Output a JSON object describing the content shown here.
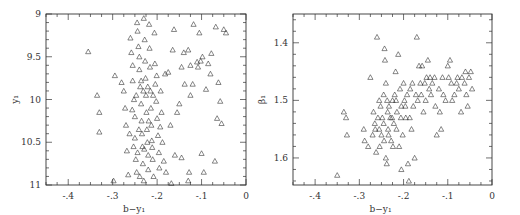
{
  "chart_data": [
    {
      "type": "scatter",
      "title": "",
      "xlabel": "b−y₁",
      "ylabel": "y₁",
      "xlim": [
        -4.5,
        0
      ],
      "ylim": [
        11,
        9
      ],
      "y_inverted": true,
      "x_ticks": [
        -4,
        -3,
        -2,
        -1,
        0
      ],
      "x_tick_labels": [
        "-.4",
        "-.3",
        "-.2",
        "-.1",
        "0"
      ],
      "y_ticks": [
        9,
        9.5,
        10,
        10.5,
        11
      ],
      "y_tick_labels": [
        "9",
        "9.5",
        "10",
        "10.5",
        "11"
      ],
      "marker": "open-triangle",
      "grid": false,
      "legend": null,
      "note": "Points approximated from visual distribution; dense vertical band around b−y≈-0.2 to -0.28",
      "points": [
        [
          -3.55,
          9.44
        ],
        [
          -3.35,
          9.95
        ],
        [
          -3.3,
          10.15
        ],
        [
          -3.3,
          10.38
        ],
        [
          -2.98,
          10.95
        ],
        [
          -2.95,
          9.72
        ],
        [
          -2.8,
          9.8
        ],
        [
          -2.75,
          9.9
        ],
        [
          -2.72,
          10.1
        ],
        [
          -2.7,
          10.3
        ],
        [
          -2.68,
          10.6
        ],
        [
          -2.65,
          10.88
        ],
        [
          -2.6,
          9.28
        ],
        [
          -2.58,
          9.45
        ],
        [
          -2.55,
          9.6
        ],
        [
          -2.55,
          9.78
        ],
        [
          -2.52,
          10.0
        ],
        [
          -2.5,
          10.2
        ],
        [
          -2.5,
          10.45
        ],
        [
          -2.48,
          10.7
        ],
        [
          -2.46,
          10.85
        ],
        [
          -2.45,
          9.1
        ],
        [
          -2.44,
          9.2
        ],
        [
          -2.42,
          9.38
        ],
        [
          -2.4,
          9.5
        ],
        [
          -2.4,
          9.65
        ],
        [
          -2.38,
          9.85
        ],
        [
          -2.36,
          10.05
        ],
        [
          -2.35,
          10.25
        ],
        [
          -2.34,
          10.4
        ],
        [
          -2.33,
          10.55
        ],
        [
          -2.32,
          10.75
        ],
        [
          -2.3,
          10.95
        ],
        [
          -2.3,
          9.05
        ],
        [
          -2.28,
          9.3
        ],
        [
          -2.27,
          9.55
        ],
        [
          -2.26,
          9.75
        ],
        [
          -2.25,
          9.95
        ],
        [
          -2.24,
          10.15
        ],
        [
          -2.23,
          10.35
        ],
        [
          -2.22,
          10.5
        ],
        [
          -2.2,
          10.65
        ],
        [
          -2.2,
          10.82
        ],
        [
          -2.18,
          9.12
        ],
        [
          -2.17,
          9.4
        ],
        [
          -2.16,
          9.62
        ],
        [
          -2.15,
          9.9
        ],
        [
          -2.14,
          10.1
        ],
        [
          -2.13,
          10.3
        ],
        [
          -2.12,
          10.48
        ],
        [
          -2.1,
          10.7
        ],
        [
          -2.08,
          10.9
        ],
        [
          -2.06,
          9.22
        ],
        [
          -2.05,
          9.58
        ],
        [
          -2.04,
          9.82
        ],
        [
          -2.02,
          10.02
        ],
        [
          -2.0,
          10.22
        ],
        [
          -1.98,
          10.42
        ],
        [
          -1.96,
          10.62
        ],
        [
          -1.95,
          10.8
        ],
        [
          -1.92,
          9.9
        ],
        [
          -1.9,
          10.15
        ],
        [
          -1.88,
          10.5
        ],
        [
          -1.85,
          10.72
        ],
        [
          -1.82,
          9.7
        ],
        [
          -1.8,
          10.85
        ],
        [
          -1.75,
          9.68
        ],
        [
          -1.7,
          10.3
        ],
        [
          -1.68,
          10.98
        ],
        [
          -1.65,
          9.42
        ],
        [
          -1.62,
          9.18
        ],
        [
          -1.6,
          10.65
        ],
        [
          -1.55,
          10.15
        ],
        [
          -1.5,
          10.05
        ],
        [
          -1.45,
          10.68
        ],
        [
          -1.45,
          9.62
        ],
        [
          -1.4,
          9.45
        ],
        [
          -1.38,
          9.82
        ],
        [
          -1.3,
          9.42
        ],
        [
          -1.3,
          10.95
        ],
        [
          -1.28,
          10.85
        ],
        [
          -1.25,
          9.95
        ],
        [
          -1.25,
          9.6
        ],
        [
          -1.2,
          9.82
        ],
        [
          -1.18,
          9.12
        ],
        [
          -1.1,
          9.56
        ],
        [
          -1.08,
          9.62
        ],
        [
          -1.05,
          9.22
        ],
        [
          -1.02,
          9.55
        ],
        [
          -1.0,
          10.63
        ],
        [
          -0.98,
          9.5
        ],
        [
          -0.95,
          10.85
        ],
        [
          -0.9,
          9.88
        ],
        [
          -0.85,
          9.58
        ],
        [
          -0.8,
          9.7
        ],
        [
          -0.78,
          9.46
        ],
        [
          -0.7,
          10.72
        ],
        [
          -0.68,
          9.15
        ],
        [
          -0.65,
          10.22
        ],
        [
          -0.62,
          9.8
        ],
        [
          -0.58,
          10.02
        ],
        [
          -0.55,
          10.28
        ],
        [
          -0.5,
          9.18
        ],
        [
          -0.45,
          9.22
        ],
        [
          -2.62,
          10.4
        ],
        [
          -2.56,
          10.12
        ],
        [
          -2.44,
          10.62
        ],
        [
          -2.36,
          9.78
        ],
        [
          -2.29,
          10.58
        ],
        [
          -2.21,
          9.85
        ],
        [
          -2.11,
          10.56
        ],
        [
          -2.01,
          9.72
        ],
        [
          -1.93,
          10.32
        ],
        [
          -2.39,
          10.9
        ],
        [
          -2.47,
          9.95
        ],
        [
          -2.31,
          9.9
        ],
        [
          -2.19,
          10.25
        ],
        [
          -2.09,
          9.95
        ],
        [
          -2.53,
          10.55
        ],
        [
          -2.41,
          10.35
        ]
      ]
    },
    {
      "type": "scatter",
      "title": "",
      "xlabel": "b−y₁",
      "ylabel": "β₁",
      "xlim": [
        -4.5,
        0
      ],
      "ylim": [
        1.647,
        1.35
      ],
      "y_inverted": true,
      "x_ticks": [
        -4,
        -3,
        -2,
        -1,
        0
      ],
      "x_tick_labels": [
        "-.4",
        "-.3",
        "-.2",
        "-.1",
        "0"
      ],
      "y_ticks": [
        1.4,
        1.5,
        1.6
      ],
      "y_tick_labels": [
        "1.4",
        "1.5",
        "1.6"
      ],
      "marker": "open-triangle",
      "grid": false,
      "legend": null,
      "note": "Points approximated; dense cluster trending from (-0.27,1.55) to (-0.1,1.47)",
      "points": [
        [
          -3.5,
          1.63
        ],
        [
          -3.35,
          1.52
        ],
        [
          -3.3,
          1.53
        ],
        [
          -3.28,
          1.56
        ],
        [
          -2.9,
          1.55
        ],
        [
          -2.88,
          1.57
        ],
        [
          -2.8,
          1.58
        ],
        [
          -2.75,
          1.46
        ],
        [
          -2.7,
          1.56
        ],
        [
          -2.68,
          1.52
        ],
        [
          -2.65,
          1.54
        ],
        [
          -2.62,
          1.59
        ],
        [
          -2.6,
          1.39
        ],
        [
          -2.58,
          1.53
        ],
        [
          -2.55,
          1.55
        ],
        [
          -2.52,
          1.51
        ],
        [
          -2.5,
          1.56
        ],
        [
          -2.48,
          1.53
        ],
        [
          -2.45,
          1.54
        ],
        [
          -2.43,
          1.41
        ],
        [
          -2.42,
          1.43
        ],
        [
          -2.4,
          1.47
        ],
        [
          -2.4,
          1.6
        ],
        [
          -2.38,
          1.61
        ],
        [
          -2.36,
          1.52
        ],
        [
          -2.35,
          1.55
        ],
        [
          -2.33,
          1.51
        ],
        [
          -2.3,
          1.53
        ],
        [
          -2.28,
          1.57
        ],
        [
          -2.25,
          1.5
        ],
        [
          -2.22,
          1.54
        ],
        [
          -2.2,
          1.49
        ],
        [
          -2.18,
          1.45
        ],
        [
          -2.15,
          1.52
        ],
        [
          -2.12,
          1.42
        ],
        [
          -2.1,
          1.58
        ],
        [
          -2.08,
          1.48
        ],
        [
          -2.05,
          1.51
        ],
        [
          -2.05,
          1.62
        ],
        [
          -2.02,
          1.56
        ],
        [
          -2.0,
          1.47
        ],
        [
          -1.98,
          1.5
        ],
        [
          -1.95,
          1.53
        ],
        [
          -1.92,
          1.49
        ],
        [
          -1.9,
          1.61
        ],
        [
          -1.88,
          1.64
        ],
        [
          -1.85,
          1.48
        ],
        [
          -1.82,
          1.55
        ],
        [
          -1.8,
          1.47
        ],
        [
          -1.78,
          1.51
        ],
        [
          -1.75,
          1.6
        ],
        [
          -1.72,
          1.49
        ],
        [
          -1.7,
          1.39
        ],
        [
          -1.68,
          1.5
        ],
        [
          -1.65,
          1.44
        ],
        [
          -1.62,
          1.47
        ],
        [
          -1.6,
          1.49
        ],
        [
          -1.58,
          1.44
        ],
        [
          -1.55,
          1.52
        ],
        [
          -1.52,
          1.47
        ],
        [
          -1.5,
          1.5
        ],
        [
          -1.48,
          1.46
        ],
        [
          -1.45,
          1.43
        ],
        [
          -1.42,
          1.48
        ],
        [
          -1.4,
          1.46
        ],
        [
          -1.38,
          1.49
        ],
        [
          -1.35,
          1.47
        ],
        [
          -1.3,
          1.46
        ],
        [
          -1.28,
          1.51
        ],
        [
          -1.25,
          1.56
        ],
        [
          -1.2,
          1.48
        ],
        [
          -1.18,
          1.52
        ],
        [
          -1.15,
          1.55
        ],
        [
          -1.12,
          1.46
        ],
        [
          -1.1,
          1.49
        ],
        [
          -1.05,
          1.5
        ],
        [
          -1.0,
          1.44
        ],
        [
          -0.98,
          1.46
        ],
        [
          -0.95,
          1.43
        ],
        [
          -0.92,
          1.47
        ],
        [
          -0.9,
          1.5
        ],
        [
          -0.85,
          1.49
        ],
        [
          -0.8,
          1.47
        ],
        [
          -0.78,
          1.46
        ],
        [
          -0.75,
          1.48
        ],
        [
          -0.7,
          1.52
        ],
        [
          -0.68,
          1.46
        ],
        [
          -0.62,
          1.47
        ],
        [
          -0.6,
          1.45
        ],
        [
          -0.58,
          1.49
        ],
        [
          -0.55,
          1.51
        ],
        [
          -0.52,
          1.46
        ],
        [
          -0.48,
          1.45
        ],
        [
          -0.45,
          1.48
        ],
        [
          -2.55,
          1.5
        ],
        [
          -2.45,
          1.49
        ],
        [
          -2.34,
          1.56
        ],
        [
          -2.26,
          1.53
        ],
        [
          -2.16,
          1.55
        ],
        [
          -2.06,
          1.53
        ],
        [
          -1.96,
          1.51
        ],
        [
          -1.86,
          1.53
        ],
        [
          -2.64,
          1.55
        ],
        [
          -2.44,
          1.57
        ],
        [
          -2.24,
          1.58
        ],
        [
          -2.54,
          1.58
        ],
        [
          -2.37,
          1.5
        ],
        [
          -2.17,
          1.5
        ]
      ]
    }
  ]
}
